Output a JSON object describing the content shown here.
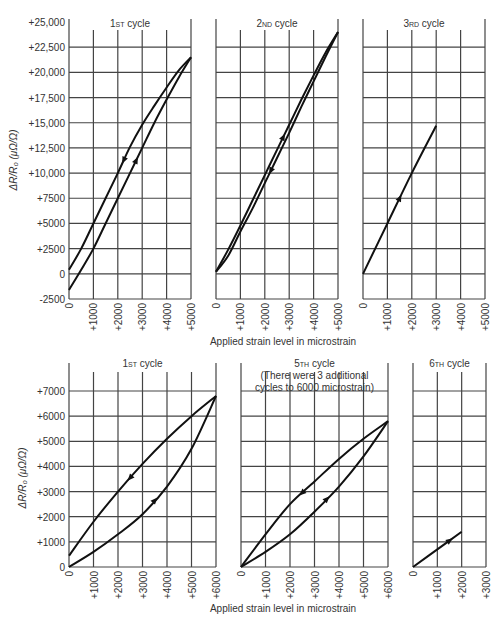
{
  "figure": {
    "top_row": {
      "ylabel": "ΔR/R₀ (μΩ/Ω)",
      "xlabel": "Applied strain level in microstrain",
      "y_ticks": [
        "+25,000",
        "+22,500",
        "+20,000",
        "+17,500",
        "+15,000",
        "+12,500",
        "+10,000",
        "+7500",
        "+5000",
        "+2500",
        "0",
        "-2500"
      ],
      "panels": [
        {
          "title": "1ST cycle",
          "x_ticks": [
            "0",
            "+1000",
            "+2000",
            "+3000",
            "+4000",
            "+5000"
          ]
        },
        {
          "title": "2ND cycle",
          "x_ticks": [
            "0",
            "+1000",
            "+2000",
            "+3000",
            "+4000",
            "+5000"
          ]
        },
        {
          "title": "3RD cycle",
          "x_ticks": [
            "0",
            "+1000",
            "+2000",
            "+3000",
            "+4000",
            "+5000"
          ]
        }
      ]
    },
    "bottom_row": {
      "ylabel": "ΔR/R₀ (μΩ/Ω)",
      "xlabel": "Applied strain level in microstrain",
      "y_ticks": [
        "+7000",
        "+6000",
        "+5000",
        "+4000",
        "+3000",
        "+2000",
        "+1000",
        "0"
      ],
      "panels": [
        {
          "title": "1ST cycle",
          "x_ticks": [
            "0",
            "+1000",
            "+2000",
            "+3000",
            "+4000",
            "+5000",
            "+6000"
          ]
        },
        {
          "title": "5TH cycle",
          "subtitle_lines": [
            "(There were 3 additional",
            "cycles to 6000 microstrain)"
          ],
          "x_ticks": [
            "0",
            "+1000",
            "+2000",
            "+3000",
            "+4000",
            "+5000",
            "+6000"
          ]
        },
        {
          "title": "6TH cycle",
          "x_ticks": [
            "0",
            "+1000",
            "+2000",
            "+3000"
          ]
        }
      ]
    }
  },
  "chart_data": [
    {
      "type": "line",
      "title": "1st cycle",
      "xlabel": "Applied strain level in microstrain",
      "ylabel": "ΔR/R0 (μΩ/Ω)",
      "xlim": [
        0,
        5000
      ],
      "ylim": [
        -2500,
        25000
      ],
      "grid": true,
      "series": [
        {
          "name": "loading",
          "x": [
            0,
            500,
            1000,
            1500,
            2000,
            2500,
            3000,
            3500,
            4000,
            4500,
            5000
          ],
          "y": [
            -1600,
            400,
            2500,
            5000,
            7500,
            10000,
            12500,
            15000,
            17300,
            19500,
            21500
          ]
        },
        {
          "name": "unloading",
          "x": [
            5000,
            4500,
            4000,
            3500,
            3000,
            2500,
            2000,
            1500,
            1000,
            500,
            0
          ],
          "y": [
            21500,
            20200,
            18500,
            16700,
            14800,
            12600,
            10000,
            7500,
            5000,
            2500,
            400
          ]
        }
      ]
    },
    {
      "type": "line",
      "title": "2nd cycle",
      "xlabel": "Applied strain level in microstrain",
      "ylabel": "ΔR/R0 (μΩ/Ω)",
      "xlim": [
        0,
        5000
      ],
      "ylim": [
        -2500,
        25000
      ],
      "grid": true,
      "series": [
        {
          "name": "loading",
          "x": [
            0,
            500,
            1000,
            1500,
            2000,
            2500,
            3000,
            3500,
            4000,
            4500,
            5000
          ],
          "y": [
            200,
            2400,
            4800,
            7300,
            9800,
            12300,
            14800,
            17300,
            19700,
            22000,
            24000
          ]
        },
        {
          "name": "unloading",
          "x": [
            5000,
            4500,
            4000,
            3500,
            3000,
            2500,
            2000,
            1500,
            1000,
            500,
            0
          ],
          "y": [
            24000,
            21600,
            19100,
            16600,
            14000,
            11500,
            9000,
            6500,
            4200,
            1800,
            200
          ]
        }
      ]
    },
    {
      "type": "line",
      "title": "3rd cycle",
      "xlabel": "Applied strain level in microstrain",
      "ylabel": "ΔR/R0 (μΩ/Ω)",
      "xlim": [
        0,
        5000
      ],
      "ylim": [
        -2500,
        25000
      ],
      "grid": true,
      "series": [
        {
          "name": "loading/unloading",
          "x": [
            0,
            1000,
            2000,
            3000
          ],
          "y": [
            0,
            5000,
            10000,
            14700
          ]
        }
      ]
    },
    {
      "type": "line",
      "title": "1st cycle",
      "xlabel": "Applied strain level in microstrain",
      "ylabel": "ΔR/R0 (μΩ/Ω)",
      "xlim": [
        0,
        6000
      ],
      "ylim": [
        0,
        7000
      ],
      "grid": true,
      "series": [
        {
          "name": "loading",
          "x": [
            0,
            1000,
            2000,
            3000,
            4000,
            5000,
            6000
          ],
          "y": [
            0,
            600,
            1300,
            2100,
            3200,
            4700,
            6800
          ]
        },
        {
          "name": "unloading",
          "x": [
            6000,
            5000,
            4000,
            3000,
            2000,
            1000,
            0
          ],
          "y": [
            6800,
            6000,
            5100,
            4100,
            3000,
            1800,
            450
          ]
        }
      ]
    },
    {
      "type": "line",
      "title": "5th cycle (There were 3 additional cycles to 6000 microstrain)",
      "xlabel": "Applied strain level in microstrain",
      "ylabel": "ΔR/R0 (μΩ/Ω)",
      "xlim": [
        0,
        6000
      ],
      "ylim": [
        0,
        7000
      ],
      "grid": true,
      "series": [
        {
          "name": "loading",
          "x": [
            0,
            1000,
            2000,
            3000,
            4000,
            5000,
            6000
          ],
          "y": [
            0,
            600,
            1300,
            2200,
            3200,
            4400,
            5800
          ]
        },
        {
          "name": "unloading",
          "x": [
            6000,
            5000,
            4000,
            3000,
            2000,
            1000,
            0
          ],
          "y": [
            5800,
            5100,
            4300,
            3400,
            2500,
            1300,
            0
          ]
        }
      ]
    },
    {
      "type": "line",
      "title": "6th cycle",
      "xlabel": "Applied strain level in microstrain",
      "ylabel": "ΔR/R0 (μΩ/Ω)",
      "xlim": [
        0,
        3000
      ],
      "ylim": [
        0,
        7000
      ],
      "grid": true,
      "series": [
        {
          "name": "loading/unloading",
          "x": [
            0,
            1000,
            2000
          ],
          "y": [
            0,
            700,
            1400
          ]
        }
      ]
    }
  ]
}
